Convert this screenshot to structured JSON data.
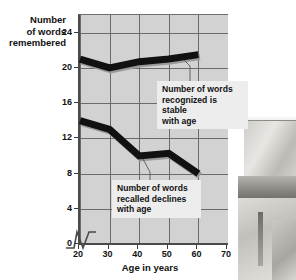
{
  "chart_data": {
    "type": "line",
    "title": "",
    "xlabel": "Age in years",
    "ylabel": "Number of words remembered",
    "ylabel_lines": [
      "Number",
      "of words",
      "remembered"
    ],
    "x": [
      20,
      30,
      40,
      50,
      60
    ],
    "xlim": [
      20,
      70
    ],
    "ylim": [
      0,
      26
    ],
    "xticks": [
      20,
      30,
      40,
      50,
      60,
      70
    ],
    "yticks": [
      0,
      4,
      8,
      12,
      16,
      20,
      24
    ],
    "grid": true,
    "legend": "none",
    "axis_break_x": true,
    "series": [
      {
        "name": "Words recognized",
        "values": [
          21.0,
          20.0,
          20.7,
          21.0,
          21.5
        ]
      },
      {
        "name": "Words recalled",
        "values": [
          14.0,
          13.0,
          10.0,
          10.3,
          8.0
        ]
      }
    ],
    "annotations": [
      {
        "id": "recognized-note",
        "lines": [
          "Number of words",
          "recognized is stable",
          "with age"
        ],
        "points_to_series": "Words recognized"
      },
      {
        "id": "recalled-note",
        "lines": [
          "Number of words",
          "recalled declines",
          "with age"
        ],
        "points_to_series": "Words recalled"
      }
    ],
    "colors": {
      "plot_background": "#d2d2d2",
      "gridlines": "#6b6b6b",
      "series_line": "#111111",
      "axis": "#4a4a4a",
      "callout_background": "#ededed",
      "text": "#111111"
    }
  }
}
